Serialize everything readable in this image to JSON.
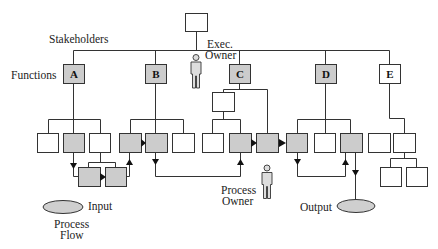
{
  "labels": {
    "stakeholders": "Stakeholders",
    "functions": "Functions",
    "exec_owner_1": "Exec.",
    "exec_owner_2": "Owner",
    "process_owner_1": "Process",
    "process_owner_2": "Owner",
    "input": "Input",
    "output": "Output",
    "process_flow_1": "Process",
    "process_flow_2": "Flow"
  },
  "functions": [
    {
      "id": "A",
      "label": "A",
      "shaded": true
    },
    {
      "id": "B",
      "label": "B",
      "shaded": true
    },
    {
      "id": "C",
      "label": "C",
      "shaded": true
    },
    {
      "id": "D",
      "label": "D",
      "shaded": true
    },
    {
      "id": "E",
      "label": "E",
      "shaded": false
    }
  ],
  "colors": {
    "line": "#333333",
    "shaded_fill": "#cccccc",
    "box_fill": "#ffffff",
    "ellipse_fill": "#cfcfcf"
  }
}
